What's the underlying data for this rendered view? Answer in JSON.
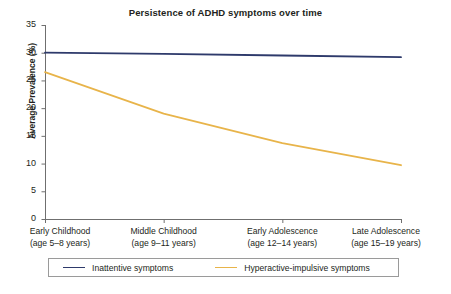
{
  "chart_data": {
    "type": "line",
    "title": "Persistence of ADHD symptoms over time",
    "xlabel": "",
    "ylabel": "Average Prevalence (%)",
    "categories": [
      "Early Childhood\n(age 5–8 years)",
      "Middle Childhood\n(age 9–11 years)",
      "Early Adolescence\n(age 12–14 years)",
      "Late Adolescence\n(age 15–19 years)"
    ],
    "category_lines": [
      [
        "Early Childhood",
        "(age 5–8 years)"
      ],
      [
        "Middle Childhood",
        "(age 9–11 years)"
      ],
      [
        "Early Adolescence",
        "(age 12–14 years)"
      ],
      [
        "Late Adolescence",
        "(age 15–19 years)"
      ]
    ],
    "series": [
      {
        "name": "Inattentive symptoms",
        "color": "#2e3a6b",
        "values": [
          30.0,
          29.8,
          29.5,
          29.2
        ]
      },
      {
        "name": "Hyperactive-impulsive symptoms",
        "color": "#e8b44a",
        "values": [
          26.5,
          19.0,
          13.7,
          9.7
        ]
      }
    ],
    "ylim": [
      0,
      35
    ],
    "yticks": [
      0,
      5,
      10,
      15,
      20,
      25,
      30,
      35
    ],
    "ytick_labels": [
      "0",
      "5",
      "10",
      "15",
      "20",
      "25",
      "30",
      "35"
    ],
    "grid": false,
    "legend_position": "bottom"
  },
  "legend": {
    "entries": [
      {
        "label": "Inattentive symptoms",
        "color": "#2e3a6b"
      },
      {
        "label": "Hyperactive-impulsive symptoms",
        "color": "#e8b44a"
      }
    ]
  },
  "colors": {
    "inattentive": "#2e3a6b",
    "hyperactive": "#e8b44a",
    "axis": "#6f6f6f",
    "text": "#231f20",
    "legend_border": "#9a9a9a"
  }
}
